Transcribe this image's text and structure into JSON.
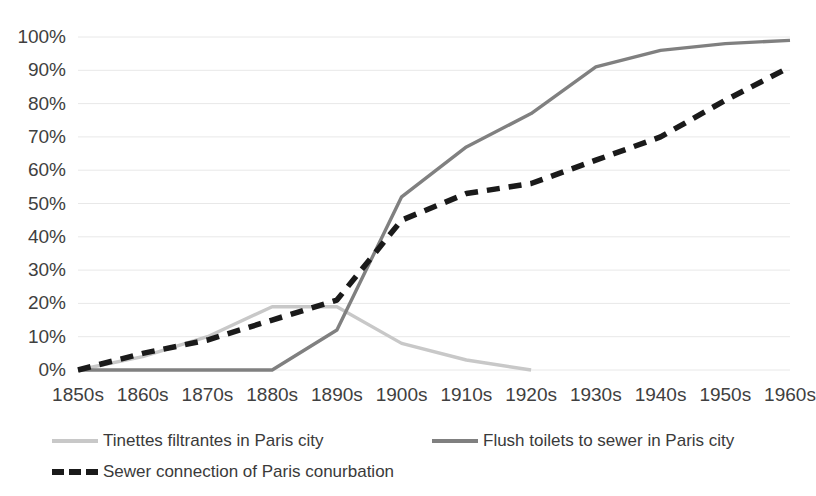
{
  "chart_data": {
    "type": "line",
    "title": "",
    "subtitle": "",
    "xlabel": "",
    "ylabel": "",
    "ylim": [
      0,
      100
    ],
    "ytick_labels": [
      "0%",
      "10%",
      "20%",
      "30%",
      "40%",
      "50%",
      "60%",
      "70%",
      "80%",
      "90%",
      "100%"
    ],
    "ytick_values": [
      0,
      10,
      20,
      30,
      40,
      50,
      60,
      70,
      80,
      90,
      100
    ],
    "grid": "horizontal",
    "legend_position": "bottom",
    "categories": [
      "1850s",
      "1860s",
      "1870s",
      "1880s",
      "1890s",
      "1900s",
      "1910s",
      "1920s",
      "1930s",
      "1940s",
      "1950s",
      "1960s"
    ],
    "series": [
      {
        "name": "Tinettes filtrantes in Paris city",
        "color": "#c8c8c8",
        "style": "solid",
        "values": [
          0,
          4,
          10,
          19,
          19,
          8,
          3,
          0,
          null,
          null,
          null,
          null
        ]
      },
      {
        "name": "Flush toilets to sewer in Paris city",
        "color": "#808080",
        "style": "solid",
        "values": [
          0,
          0,
          0,
          0,
          12,
          52,
          67,
          77,
          91,
          96,
          98,
          99
        ]
      },
      {
        "name": "Sewer connection of Paris conurbation",
        "color": "#1a1a1a",
        "style": "dashed",
        "values": [
          0,
          5,
          9,
          15,
          21,
          45,
          53,
          56,
          63,
          70,
          81,
          91
        ]
      }
    ]
  },
  "legend": {
    "items": [
      {
        "label": "Tinettes filtrantes in Paris city"
      },
      {
        "label": "Flush toilets to sewer in Paris city"
      },
      {
        "label": "Sewer connection of Paris conurbation"
      }
    ]
  }
}
